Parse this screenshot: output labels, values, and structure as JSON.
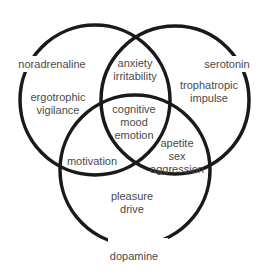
{
  "diagram": {
    "type": "venn-3",
    "stroke_color": "#1a1a1a",
    "text_color": "#4a4a4a",
    "circles": [
      {
        "name": "noradrenaline",
        "label": "noradrenaline",
        "cx": 95,
        "cy": 100,
        "r": 75
      },
      {
        "name": "serotonin",
        "label": "serotonin",
        "cx": 175,
        "cy": 100,
        "r": 74
      },
      {
        "name": "dopamine",
        "label": "dopamine",
        "cx": 135,
        "cy": 170,
        "r": 75
      }
    ],
    "regions": {
      "noradrenaline_only": [
        "ergotrophic",
        "vigilance"
      ],
      "serotonin_only": [
        "trophatropic",
        "impulse"
      ],
      "dopamine_only": [
        "pleasure",
        "drive"
      ],
      "noradrenaline_serotonin": [
        "anxiety",
        "irritability"
      ],
      "noradrenaline_dopamine": [
        "motivation"
      ],
      "serotonin_dopamine": [
        "apetite",
        "sex",
        "aggression"
      ],
      "all_three": [
        "cognitive",
        "mood",
        "emotion"
      ]
    }
  }
}
